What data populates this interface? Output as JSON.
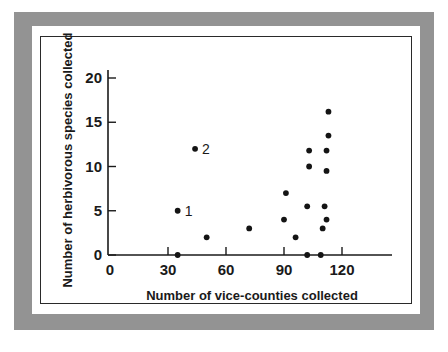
{
  "figure": {
    "frame_color": "#939393",
    "matte_color": "#ffffff",
    "border_color": "#2a2a2a",
    "point_color": "#141414"
  },
  "chart_data": {
    "type": "scatter",
    "title": "",
    "xlabel": "Number of vice-counties collected",
    "ylabel": "Number of herbivorous species collected",
    "xlim": [
      0,
      135
    ],
    "ylim": [
      -1,
      21
    ],
    "xticks": [
      0,
      30,
      60,
      90,
      120
    ],
    "yticks": [
      0,
      5,
      10,
      15,
      20
    ],
    "xtick_labels": [
      "0",
      "30",
      "60",
      "90",
      "120"
    ],
    "ytick_labels": [
      "0",
      "5",
      "10",
      "15",
      "20"
    ],
    "grid": false,
    "legend": "none",
    "series": [
      {
        "name": "vice-counties vs herbivorous species",
        "points": [
          {
            "x": 35,
            "y": 0,
            "label": ""
          },
          {
            "x": 35,
            "y": 5,
            "label": "1"
          },
          {
            "x": 44,
            "y": 12,
            "label": "2"
          },
          {
            "x": 50,
            "y": 2,
            "label": ""
          },
          {
            "x": 72,
            "y": 3,
            "label": ""
          },
          {
            "x": 90,
            "y": 4,
            "label": ""
          },
          {
            "x": 91,
            "y": 7,
            "label": ""
          },
          {
            "x": 96,
            "y": 2,
            "label": ""
          },
          {
            "x": 102,
            "y": 0,
            "label": ""
          },
          {
            "x": 102,
            "y": 5.5,
            "label": ""
          },
          {
            "x": 103,
            "y": 10,
            "label": ""
          },
          {
            "x": 103,
            "y": 11.8,
            "label": ""
          },
          {
            "x": 109,
            "y": 0,
            "label": ""
          },
          {
            "x": 110,
            "y": 3,
            "label": ""
          },
          {
            "x": 111,
            "y": 5.5,
            "label": ""
          },
          {
            "x": 112,
            "y": 4,
            "label": ""
          },
          {
            "x": 112,
            "y": 9.5,
            "label": ""
          },
          {
            "x": 112,
            "y": 11.8,
            "label": ""
          },
          {
            "x": 113,
            "y": 13.5,
            "label": ""
          },
          {
            "x": 113,
            "y": 16.2,
            "label": ""
          }
        ]
      }
    ],
    "annotations": [
      {
        "text": "1",
        "x": 35,
        "y": 5
      },
      {
        "text": "2",
        "x": 44,
        "y": 12
      }
    ]
  }
}
